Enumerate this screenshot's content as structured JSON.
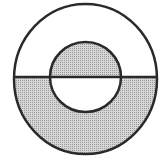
{
  "diagram": {
    "colors": {
      "background": "#ffffff",
      "stroke": "#2a2a2a",
      "shade": "#c8c8c8"
    },
    "outer_circle": {
      "cx": 85.5,
      "cy": 79,
      "rx": 71.5,
      "ry": 75
    },
    "inner_circle": {
      "cx": 85.5,
      "cy": 77,
      "rx": 35.5,
      "ry": 35
    },
    "divider_y": 77,
    "shaded_regions": [
      "inner-circle-upper-half",
      "outer-ring-lower-half"
    ]
  }
}
